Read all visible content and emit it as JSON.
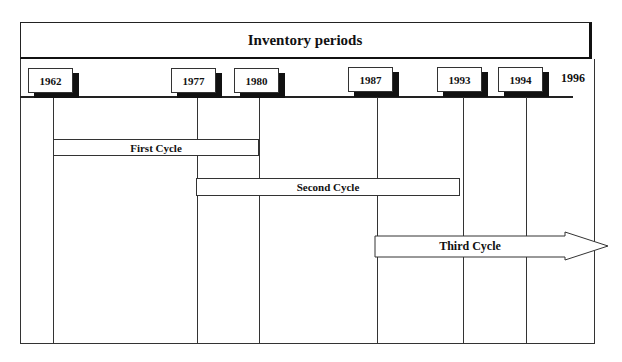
{
  "diagram": {
    "title": "Inventory periods",
    "years": [
      {
        "label": "1962",
        "x": 53
      },
      {
        "label": "1977",
        "x": 197
      },
      {
        "label": "1980",
        "x": 259
      },
      {
        "label": "1987",
        "x": 377
      },
      {
        "label": "1993",
        "x": 463
      },
      {
        "label": "1994",
        "x": 526
      }
    ],
    "end_year": "1996",
    "cycles": [
      {
        "label": "First Cycle",
        "from": "1962",
        "to": "1980"
      },
      {
        "label": "Second Cycle",
        "from": "1977",
        "to": "1993"
      },
      {
        "label": "Third Cycle",
        "from": "1987",
        "to": "ongoing (arrow)"
      }
    ]
  }
}
